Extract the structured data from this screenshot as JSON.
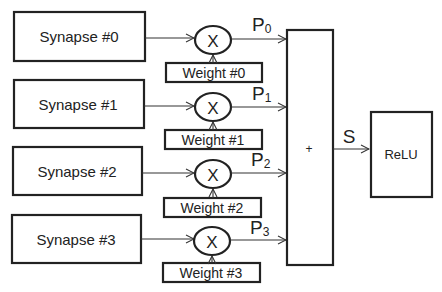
{
  "synapses": [
    {
      "label": "Synapse #0"
    },
    {
      "label": "Synapse #1"
    },
    {
      "label": "Synapse #2"
    },
    {
      "label": "Synapse #3"
    }
  ],
  "multipliers": [
    {
      "symbol": "X"
    },
    {
      "symbol": "X"
    },
    {
      "symbol": "X"
    },
    {
      "symbol": "X"
    }
  ],
  "weights": [
    {
      "label": "Weight #0"
    },
    {
      "label": "Weight #1"
    },
    {
      "label": "Weight #2"
    },
    {
      "label": "Weight #3"
    }
  ],
  "products": [
    {
      "letter": "P",
      "sub": "0"
    },
    {
      "letter": "P",
      "sub": "1"
    },
    {
      "letter": "P",
      "sub": "2"
    },
    {
      "letter": "P",
      "sub": "3"
    }
  ],
  "adder": {
    "symbol": "+"
  },
  "sum_label": "S",
  "activation": {
    "label": "ReLU"
  }
}
